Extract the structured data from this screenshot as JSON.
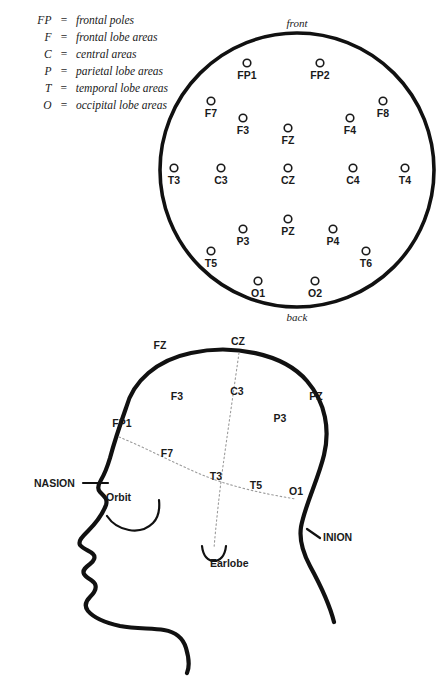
{
  "legend": {
    "rows": [
      {
        "symbol": "FP",
        "equals": "=",
        "description": "frontal poles"
      },
      {
        "symbol": "F",
        "equals": "=",
        "description": "frontal lobe areas"
      },
      {
        "symbol": "C",
        "equals": "=",
        "description": "central areas"
      },
      {
        "symbol": "P",
        "equals": "=",
        "description": "parietal lobe areas"
      },
      {
        "symbol": "T",
        "equals": "=",
        "description": "temporal lobe areas"
      },
      {
        "symbol": "O",
        "equals": "=",
        "description": "occipital lobe areas"
      }
    ]
  },
  "top_view": {
    "orientation_front": "front",
    "orientation_back": "back",
    "electrodes": [
      {
        "label": "FP1",
        "cx": 247,
        "cy": 63,
        "lx": 247,
        "ly": 79
      },
      {
        "label": "FP2",
        "cx": 320,
        "cy": 63,
        "lx": 320,
        "ly": 79
      },
      {
        "label": "F7",
        "cx": 211,
        "cy": 101,
        "lx": 211,
        "ly": 117
      },
      {
        "label": "F8",
        "cx": 383,
        "cy": 101,
        "lx": 383,
        "ly": 117
      },
      {
        "label": "F3",
        "cx": 243,
        "cy": 118,
        "lx": 243,
        "ly": 134
      },
      {
        "label": "F4",
        "cx": 350,
        "cy": 118,
        "lx": 350,
        "ly": 134
      },
      {
        "label": "FZ",
        "cx": 288,
        "cy": 128,
        "lx": 288,
        "ly": 144
      },
      {
        "label": "T3",
        "cx": 174,
        "cy": 168,
        "lx": 174,
        "ly": 184
      },
      {
        "label": "C3",
        "cx": 221,
        "cy": 168,
        "lx": 221,
        "ly": 184
      },
      {
        "label": "CZ",
        "cx": 288,
        "cy": 168,
        "lx": 288,
        "ly": 184
      },
      {
        "label": "C4",
        "cx": 353,
        "cy": 168,
        "lx": 353,
        "ly": 184
      },
      {
        "label": "T4",
        "cx": 405,
        "cy": 168,
        "lx": 405,
        "ly": 184
      },
      {
        "label": "PZ",
        "cx": 288,
        "cy": 219,
        "lx": 288,
        "ly": 235
      },
      {
        "label": "P3",
        "cx": 243,
        "cy": 229,
        "lx": 243,
        "ly": 245
      },
      {
        "label": "P4",
        "cx": 333,
        "cy": 229,
        "lx": 333,
        "ly": 245
      },
      {
        "label": "T5",
        "cx": 211,
        "cy": 251,
        "lx": 211,
        "ly": 267
      },
      {
        "label": "T6",
        "cx": 366,
        "cy": 251,
        "lx": 366,
        "ly": 267
      },
      {
        "label": "O1",
        "cx": 258,
        "cy": 281,
        "lx": 258,
        "ly": 297
      },
      {
        "label": "O2",
        "cx": 315,
        "cy": 281,
        "lx": 315,
        "ly": 297
      }
    ]
  },
  "side_view": {
    "electrodes": [
      {
        "label": "FZ",
        "x": 160,
        "y": 349
      },
      {
        "label": "CZ",
        "x": 238,
        "y": 345
      },
      {
        "label": "F3",
        "x": 177,
        "y": 400
      },
      {
        "label": "C3",
        "x": 237,
        "y": 395
      },
      {
        "label": "PZ",
        "x": 316,
        "y": 400
      },
      {
        "label": "P3",
        "x": 280,
        "y": 422
      },
      {
        "label": "FP1",
        "x": 122,
        "y": 427
      },
      {
        "label": "F7",
        "x": 167,
        "y": 457
      },
      {
        "label": "T3",
        "x": 216,
        "y": 480
      },
      {
        "label": "T5",
        "x": 256,
        "y": 489
      },
      {
        "label": "O1",
        "x": 296,
        "y": 495
      }
    ],
    "anatomical_labels": [
      {
        "label": "NASION",
        "x": 34,
        "y": 487
      },
      {
        "label": "INION",
        "x": 323,
        "y": 541
      },
      {
        "label": "Orbit",
        "x": 106,
        "y": 501
      },
      {
        "label": "Earlobe",
        "x": 210,
        "y": 567
      }
    ]
  },
  "colors": {
    "ink": "#1a1a1a",
    "outline": "#111111",
    "dotted": "#9a9a9a",
    "background": "#ffffff"
  }
}
